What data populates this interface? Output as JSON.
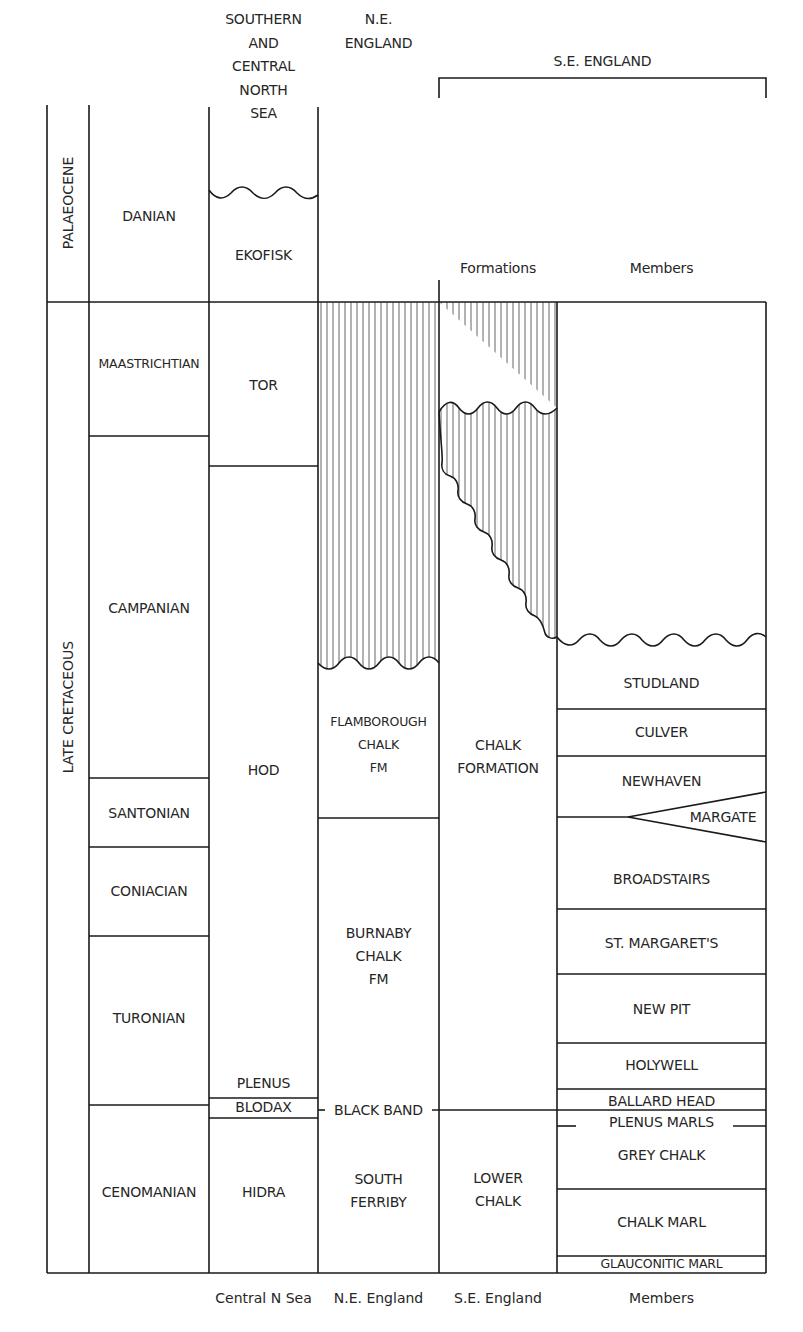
{
  "diagram": {
    "column_headers": {
      "north_sea": "SOUTHERN\nAND\nCENTRAL\nNORTH\nSEA",
      "ne_england": "N.E.\nENGLAND",
      "se_england": "S.E. ENGLAND",
      "formations": "Formations",
      "members": "Members"
    },
    "epochs": [
      {
        "label": "PALAEOCENE"
      },
      {
        "label": "LATE CRETACEOUS"
      }
    ],
    "stages": [
      {
        "label": "DANIAN"
      },
      {
        "label": "MAASTRICHTIAN"
      },
      {
        "label": "CAMPANIAN"
      },
      {
        "label": "SANTONIAN"
      },
      {
        "label": "CONIACIAN"
      },
      {
        "label": "TURONIAN"
      },
      {
        "label": "CENOMANIAN"
      }
    ],
    "north_sea_units": [
      {
        "label": "EKOFISK"
      },
      {
        "label": "TOR"
      },
      {
        "label": "HOD"
      },
      {
        "label": "PLENUS"
      },
      {
        "label": "BLODAX"
      },
      {
        "label": "HIDRA"
      }
    ],
    "ne_england_units": [
      {
        "label": "FLAMBOROUGH\nCHALK\nFM"
      },
      {
        "label": "BURNABY\nCHALK\nFM"
      },
      {
        "label": "BLACK BAND"
      },
      {
        "label": "SOUTH\nFERRIBY"
      }
    ],
    "se_formations": [
      {
        "label": "CHALK\nFORMATION"
      },
      {
        "label": "LOWER\nCHALK"
      }
    ],
    "se_members": [
      {
        "label": "STUDLAND"
      },
      {
        "label": "CULVER"
      },
      {
        "label": "NEWHAVEN"
      },
      {
        "label": "MARGATE"
      },
      {
        "label": "BROADSTAIRS"
      },
      {
        "label": "ST. MARGARET'S"
      },
      {
        "label": "NEW PIT"
      },
      {
        "label": "HOLYWELL"
      },
      {
        "label": "BALLARD HEAD"
      },
      {
        "label": "PLENUS MARLS"
      },
      {
        "label": "GREY CHALK"
      },
      {
        "label": "CHALK MARL"
      },
      {
        "label": "GLAUCONITIC MARL"
      }
    ],
    "footer_labels": [
      {
        "label": "Central N Sea"
      },
      {
        "label": "N.E. England"
      },
      {
        "label": "S.E. England"
      },
      {
        "label": "Members"
      }
    ],
    "legend": {
      "hatched_meaning": "hiatus / missing section",
      "wavy_line_meaning": "unconformity"
    },
    "colors": {
      "line": "#1a1a1a",
      "hatch": "#555555",
      "text": "#262626",
      "background": "#ffffff"
    }
  }
}
